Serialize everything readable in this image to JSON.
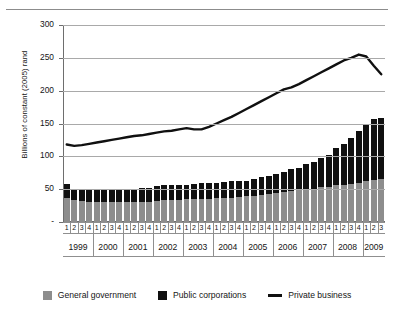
{
  "chart_data": {
    "type": "bar",
    "title": "",
    "subtitle": "",
    "xlabel": "",
    "ylabel": "Billions of constant (2005) rand",
    "ylim": [
      0,
      300
    ],
    "yticks": [
      0,
      50,
      100,
      150,
      200,
      250,
      300
    ],
    "ytick_labels": [
      "-",
      "50",
      "100",
      "150",
      "200",
      "250",
      "300"
    ],
    "grid": true,
    "legend_position": "bottom",
    "stacked": true,
    "quarter_labels": [
      "1",
      "2",
      "3",
      "4"
    ],
    "categories": [
      "1999 Q1",
      "1999 Q2",
      "1999 Q3",
      "1999 Q4",
      "2000 Q1",
      "2000 Q2",
      "2000 Q3",
      "2000 Q4",
      "2001 Q1",
      "2001 Q2",
      "2001 Q3",
      "2001 Q4",
      "2002 Q1",
      "2002 Q2",
      "2002 Q3",
      "2002 Q4",
      "2003 Q1",
      "2003 Q2",
      "2003 Q3",
      "2003 Q4",
      "2004 Q1",
      "2004 Q2",
      "2004 Q3",
      "2004 Q4",
      "2005 Q1",
      "2005 Q2",
      "2005 Q3",
      "2005 Q4",
      "2006 Q1",
      "2006 Q2",
      "2006 Q3",
      "2006 Q4",
      "2007 Q1",
      "2007 Q2",
      "2007 Q3",
      "2007 Q4",
      "2008 Q1",
      "2008 Q2",
      "2008 Q3",
      "2008 Q4",
      "2009 Q1",
      "2009 Q2",
      "2009 Q3"
    ],
    "years": [
      {
        "year": "1999",
        "quarters": [
          "1",
          "2",
          "3",
          "4"
        ]
      },
      {
        "year": "2000",
        "quarters": [
          "1",
          "2",
          "3",
          "4"
        ]
      },
      {
        "year": "2001",
        "quarters": [
          "1",
          "2",
          "3",
          "4"
        ]
      },
      {
        "year": "2002",
        "quarters": [
          "1",
          "2",
          "3",
          "4"
        ]
      },
      {
        "year": "2003",
        "quarters": [
          "1",
          "2",
          "3",
          "4"
        ]
      },
      {
        "year": "2004",
        "quarters": [
          "1",
          "2",
          "3",
          "4"
        ]
      },
      {
        "year": "2005",
        "quarters": [
          "1",
          "2",
          "3",
          "4"
        ]
      },
      {
        "year": "2006",
        "quarters": [
          "1",
          "2",
          "3",
          "4"
        ]
      },
      {
        "year": "2007",
        "quarters": [
          "1",
          "2",
          "3",
          "4"
        ]
      },
      {
        "year": "2008",
        "quarters": [
          "1",
          "2",
          "3",
          "4"
        ]
      },
      {
        "year": "2009",
        "quarters": [
          "1",
          "2",
          "3"
        ]
      }
    ],
    "series": [
      {
        "name": "General government",
        "color": "#8d8d8d",
        "type": "bar",
        "values": [
          36,
          33,
          32,
          31,
          31,
          31,
          31,
          31,
          31,
          31,
          31,
          31,
          32,
          33,
          33,
          34,
          35,
          35,
          35,
          35,
          36,
          36,
          37,
          38,
          39,
          40,
          41,
          42,
          44,
          45,
          47,
          48,
          50,
          51,
          53,
          54,
          56,
          57,
          58,
          60,
          62,
          64,
          66
        ]
      },
      {
        "name": "Public corporations",
        "color": "#101010",
        "type": "bar",
        "values": [
          22,
          18,
          18,
          19,
          20,
          20,
          20,
          20,
          19,
          20,
          21,
          21,
          23,
          23,
          23,
          23,
          22,
          23,
          24,
          24,
          24,
          25,
          25,
          25,
          24,
          25,
          27,
          28,
          29,
          31,
          33,
          35,
          38,
          41,
          44,
          48,
          56,
          62,
          70,
          78,
          88,
          93,
          92
        ]
      },
      {
        "name": "Private business",
        "color": "#101010",
        "type": "line",
        "values": [
          118,
          116,
          117,
          119,
          121,
          123,
          125,
          127,
          129,
          131,
          132,
          134,
          136,
          138,
          139,
          141,
          143,
          141,
          141,
          145,
          150,
          155,
          160,
          166,
          172,
          178,
          184,
          190,
          196,
          202,
          205,
          210,
          216,
          222,
          228,
          234,
          240,
          246,
          250,
          255,
          252,
          238,
          225
        ]
      }
    ]
  },
  "legend": {
    "items": [
      {
        "label": "General government",
        "swatch": "square",
        "color": "#8d8d8d"
      },
      {
        "label": "Public corporations",
        "swatch": "square",
        "color": "#101010"
      },
      {
        "label": "Private business",
        "swatch": "line",
        "color": "#101010"
      }
    ]
  }
}
